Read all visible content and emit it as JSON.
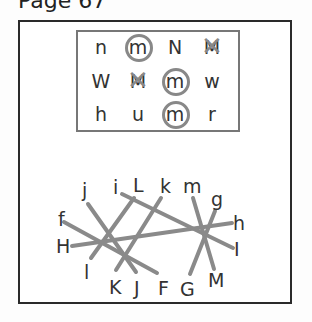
{
  "page": {
    "title": "Page 67"
  },
  "letter_grid": {
    "rows": [
      [
        {
          "ch": "n",
          "mark": "none"
        },
        {
          "ch": "m",
          "mark": "circle"
        },
        {
          "ch": "N",
          "mark": "none"
        },
        {
          "ch": "M",
          "mark": "cross"
        }
      ],
      [
        {
          "ch": "W",
          "mark": "none"
        },
        {
          "ch": "M",
          "mark": "cross"
        },
        {
          "ch": "m",
          "mark": "circle"
        },
        {
          "ch": "w",
          "mark": "none"
        }
      ],
      [
        {
          "ch": "h",
          "mark": "none"
        },
        {
          "ch": "u",
          "mark": "none"
        },
        {
          "ch": "m",
          "mark": "circle"
        },
        {
          "ch": "r",
          "mark": "none"
        }
      ]
    ]
  },
  "matching": {
    "labels": {
      "j": "j",
      "i": "i",
      "L": "L",
      "k": "k",
      "m": "m",
      "g": "g",
      "f": "f",
      "h": "h",
      "H": "H",
      "I": "I",
      "l": "l",
      "K": "K",
      "J": "J",
      "F": "F",
      "G": "G",
      "M": "M"
    },
    "pairs": [
      [
        "j",
        "J"
      ],
      [
        "f",
        "F"
      ],
      [
        "H",
        "h"
      ],
      [
        "i",
        "I"
      ],
      [
        "L",
        "l"
      ],
      [
        "k",
        "K"
      ],
      [
        "m",
        "M"
      ],
      [
        "g",
        "G"
      ]
    ],
    "line_color": "#8a8a8a"
  }
}
